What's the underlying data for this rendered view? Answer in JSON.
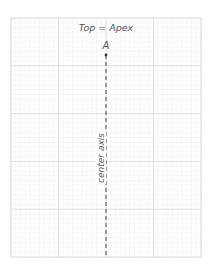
{
  "diagram": {
    "title": "Top = Apex",
    "apex_label": "A",
    "axis_label": "center axis",
    "colors": {
      "background": "#ffffff",
      "minor_grid": "#ececec",
      "major_grid": "#dadada",
      "border": "#d6d6d6",
      "axis": "#444444",
      "text": "#555555"
    },
    "grid": {
      "minor_divisions_x": 40,
      "minor_divisions_y": 50,
      "major_every": 10
    }
  }
}
